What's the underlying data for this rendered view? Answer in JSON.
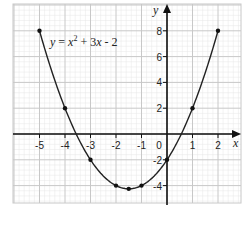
{
  "chart_data": {
    "type": "line",
    "title": "",
    "annotation": "y = x² + 3x - 2",
    "xlabel": "x",
    "ylabel": "y",
    "xlim": [
      -6,
      2.8
    ],
    "ylim": [
      -5.4,
      10
    ],
    "x_ticks": [
      -5,
      -4,
      -3,
      -2,
      -1,
      0,
      1,
      2
    ],
    "y_ticks": [
      -4,
      -2,
      2,
      4,
      6,
      8
    ],
    "grid": true,
    "series": [
      {
        "name": "y = x^2 + 3x - 2",
        "points": [
          {
            "x": -5,
            "y": 8
          },
          {
            "x": -4,
            "y": 2
          },
          {
            "x": -3,
            "y": -2
          },
          {
            "x": -2,
            "y": -4
          },
          {
            "x": -1.5,
            "y": -4.25
          },
          {
            "x": -1,
            "y": -4
          },
          {
            "x": 0,
            "y": -2
          },
          {
            "x": 1,
            "y": 2
          },
          {
            "x": 2,
            "y": 8
          }
        ]
      }
    ]
  },
  "labels": {
    "x_axis": "x",
    "y_axis": "y",
    "origin": "0",
    "equation_y": "y",
    "equation_eq": " = ",
    "equation_x": "x",
    "equation_sup": "2",
    "equation_rest": " + 3",
    "equation_x2": "x",
    "equation_tail": " - 2"
  },
  "colors": {
    "curve": "#222222",
    "axis": "#111111",
    "grid_major": "#c8c8c8",
    "grid_minor": "#e6e6e6",
    "point": "#111111"
  }
}
